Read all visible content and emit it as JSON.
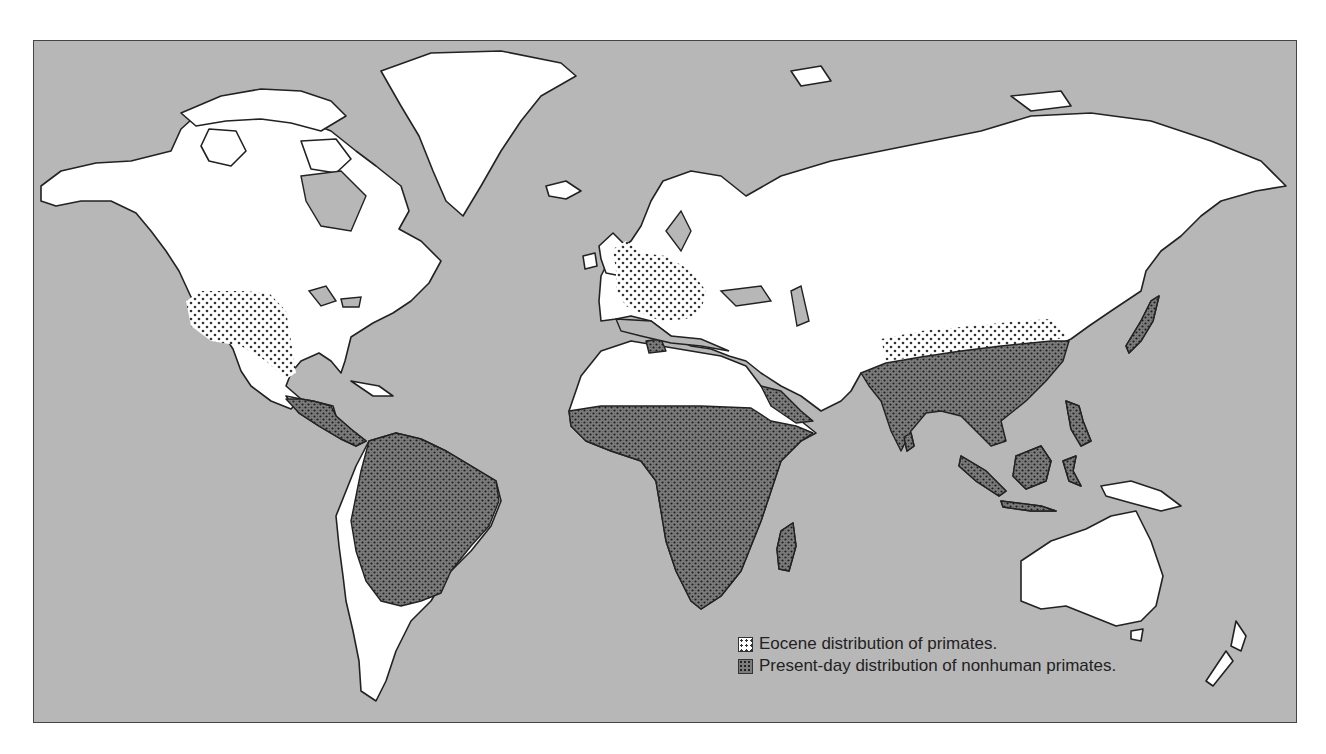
{
  "map": {
    "title": "World map of primate distribution",
    "colors": {
      "ocean": "#b7b7b7",
      "land": "#ffffff",
      "coastline": "#222222",
      "present_day_fill": "#7c7c7c",
      "eocene_fill": "#ffffff",
      "pattern_dot": "#222222"
    },
    "regions": {
      "eocene": [
        "North America (western/central US)",
        "Western Europe",
        "East Asia (central China)"
      ],
      "present_day": [
        "Central America",
        "South America (Amazon basin to northern Argentina)",
        "Sub-Saharan Africa",
        "Madagascar",
        "Arabian coast / Horn of Africa",
        "Northwest Africa (Morocco/Algeria spots)",
        "South Asia",
        "Southeast Asia",
        "Southern China",
        "Japan",
        "Indonesia / Borneo / Sumatra",
        "Philippines"
      ]
    }
  },
  "legend": {
    "items": [
      {
        "key": "eocene",
        "label": "Eocene distribution of primates."
      },
      {
        "key": "present_day",
        "label": "Present-day distribution of nonhuman primates."
      }
    ]
  }
}
